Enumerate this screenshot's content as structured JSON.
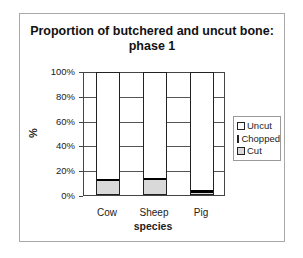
{
  "chart_data": {
    "type": "bar",
    "stacked": "percent",
    "title": "Proportion of butchered and uncut bone: phase 1",
    "title_lines": [
      "Proportion of butchered and uncut bone:",
      "phase 1"
    ],
    "xlabel": "species",
    "ylabel": "%",
    "ylim": [
      0,
      100
    ],
    "yticks": [
      "0%",
      "20%",
      "40%",
      "60%",
      "80%",
      "100%"
    ],
    "grid": true,
    "legend_position": "right",
    "categories": [
      "Cow",
      "Sheep",
      "Pig"
    ],
    "series": [
      {
        "name": "Cut",
        "color": "#d9d9d9",
        "values": [
          11,
          12,
          1
        ]
      },
      {
        "name": "Chopped",
        "color": "#000000",
        "values": [
          1,
          1,
          2
        ]
      },
      {
        "name": "Uncut",
        "color": "#ffffff",
        "values": [
          88,
          87,
          97
        ]
      }
    ],
    "legend": [
      "Uncut",
      "Chopped",
      "Cut"
    ]
  }
}
